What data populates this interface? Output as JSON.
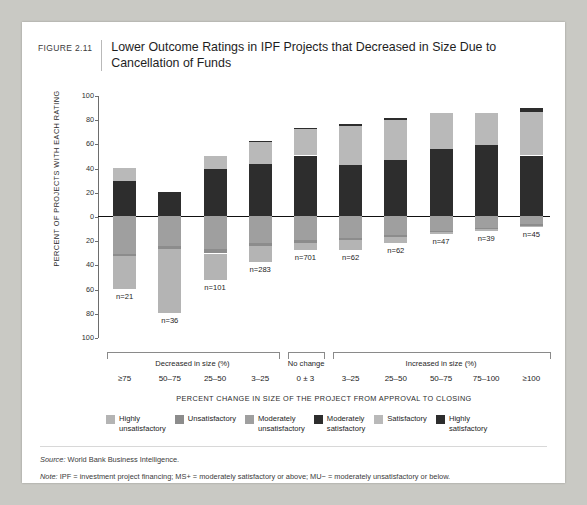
{
  "figure": {
    "number": "FIGURE 2.11",
    "title": "Lower Outcome Ratings in IPF Projects that Decreased in Size Due to Cancellation of Funds"
  },
  "notes": {
    "source_label": "Source:",
    "source_text": " World Bank Business Intelligence.",
    "note_label": "Note:",
    "note_text": " IPF = investment project financing; MS+ = moderately satisfactory or above; MU− = moderately unsatisfactory or below."
  },
  "chart_data": {
    "type": "bar",
    "title": "Lower Outcome Ratings in IPF Projects that Decreased in Size Due to Cancellation of Funds",
    "xlabel": "PERCENT CHANGE IN SIZE OF THE PROJECT FROM APPROVAL TO CLOSING",
    "ylabel": "PERCENT OF PROJECTS WITH EACH RATING",
    "ylim": [
      -100,
      100
    ],
    "yticks": [
      "100",
      "80",
      "60",
      "40",
      "20",
      "0",
      "20",
      "40",
      "60",
      "80",
      "100"
    ],
    "grid": false,
    "legend_position": "bottom",
    "stacked": "diverging",
    "categories": [
      "≥75",
      "50–75",
      "25–50",
      "3–25",
      "0 ± 3",
      "3–25",
      "25–50",
      "50–75",
      "75–100",
      "≥100"
    ],
    "group_labels": [
      "Decreased in size (%)",
      "No change",
      "Increased in size (%)"
    ],
    "groups": [
      {
        "label": "Decreased in size (%)",
        "from": 0,
        "to": 3
      },
      {
        "label": "No change",
        "from": 4,
        "to": 4
      },
      {
        "label": "Increased in size (%)",
        "from": 5,
        "to": 9
      }
    ],
    "n_labels": [
      "n=21",
      "n=36",
      "n=101",
      "n=283",
      "n=701",
      "n=62",
      "n=62",
      "n=47",
      "n=39",
      "n=45"
    ],
    "series": [
      {
        "name": "Highly unsatisfactory",
        "color": "#b4b4b4",
        "direction": "down",
        "values": [
          27,
          53,
          22,
          13,
          6,
          8,
          5,
          2,
          1,
          1
        ]
      },
      {
        "name": "Unsatisfactory",
        "color": "#8c8c8c",
        "direction": "down",
        "values": [
          2,
          2,
          4,
          3,
          2,
          2,
          1,
          1,
          1,
          1
        ]
      },
      {
        "name": "Moderately unsatisfactory",
        "color": "#9f9f9f",
        "direction": "down",
        "values": [
          31,
          25,
          27,
          22,
          20,
          18,
          16,
          12,
          10,
          7
        ]
      },
      {
        "name": "Moderately satisfactory",
        "color": "#2d2d2d",
        "direction": "up",
        "values": [
          29,
          20,
          39,
          43,
          50,
          42,
          46,
          55,
          59,
          50
        ]
      },
      {
        "name": "Satisfactory",
        "color": "#b9b9b9",
        "direction": "up",
        "values": [
          11,
          0,
          11,
          18,
          22,
          32,
          33,
          30,
          26,
          36
        ]
      },
      {
        "name": "Highly satisfactory",
        "color": "#2d2d2d",
        "direction": "up",
        "values": [
          0,
          0,
          0,
          1,
          1,
          2,
          2,
          0,
          0,
          3
        ]
      }
    ]
  },
  "legend": [
    {
      "label_line1": "Highly",
      "label_line2": "unsatisfactory",
      "color": "#b4b4b4"
    },
    {
      "label_line1": "Unsatisfactory",
      "label_line2": "",
      "color": "#8c8c8c"
    },
    {
      "label_line1": "Moderately",
      "label_line2": "unsatisfactory",
      "color": "#9f9f9f"
    },
    {
      "label_line1": "Moderately",
      "label_line2": "satisfactory",
      "color": "#2d2d2d"
    },
    {
      "label_line1": "Satisfactory",
      "label_line2": "",
      "color": "#b9b9b9"
    },
    {
      "label_line1": "Highly",
      "label_line2": "satisfactory",
      "color": "#2d2d2d"
    }
  ]
}
